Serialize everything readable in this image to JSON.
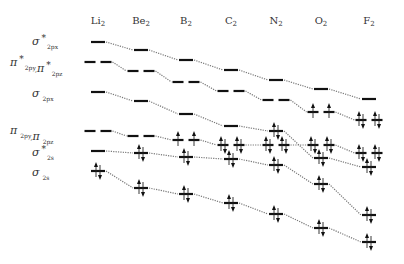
{
  "diagram": {
    "molecules": [
      {
        "label": "Li",
        "sub": "2",
        "x": 98
      },
      {
        "label": "Be",
        "sub": "2",
        "x": 141
      },
      {
        "label": "B",
        "sub": "2",
        "x": 186
      },
      {
        "label": "C",
        "sub": "2",
        "x": 231
      },
      {
        "label": "N",
        "sub": "2",
        "x": 276
      },
      {
        "label": "O",
        "sub": "2",
        "x": 321
      },
      {
        "label": "F",
        "sub": "2",
        "x": 369
      }
    ],
    "orbital_labels": [
      {
        "id": "sigma_star_2px",
        "symbol": "σ",
        "star": "*",
        "sub": "2px",
        "y": 45
      },
      {
        "id": "pi_star_2p",
        "symbol": "π",
        "star": "*",
        "sub": "2py",
        "symbol2": "π",
        "star2": "*",
        "sub2": "2pz",
        "y": 66
      },
      {
        "id": "sigma_2px",
        "symbol": "σ",
        "star": "",
        "sub": "2px",
        "y": 97
      },
      {
        "id": "pi_2p",
        "symbol": "π",
        "star": "",
        "sub": "2py",
        "symbol2": "π",
        "star2": "",
        "sub2": "2pz",
        "y": 134
      },
      {
        "id": "sigma_star_2s",
        "symbol": "σ",
        "star": "*",
        "sub": "2s",
        "y": 156
      },
      {
        "id": "sigma_2s",
        "symbol": "σ",
        "star": "",
        "sub": "2s",
        "y": 176
      }
    ],
    "orbitals": {
      "sigma_star_2px": {
        "degenerate": false,
        "y": [
          42,
          50,
          60,
          70,
          80,
          89,
          99
        ],
        "electrons": [
          0,
          0,
          0,
          0,
          0,
          0,
          0
        ]
      },
      "pi_star_2p": {
        "degenerate": true,
        "y": [
          62,
          71,
          82,
          91,
          100,
          112,
          120
        ],
        "electrons": [
          0,
          0,
          0,
          0,
          0,
          2,
          4
        ]
      },
      "sigma_2px": {
        "degenerate": false,
        "y": [
          92,
          101,
          114,
          126,
          131,
          158,
          167
        ],
        "electrons": [
          0,
          0,
          0,
          0,
          2,
          2,
          2
        ]
      },
      "pi_2p": {
        "degenerate": true,
        "y": [
          131,
          136,
          140,
          145,
          145,
          145,
          153
        ],
        "electrons": [
          0,
          0,
          2,
          4,
          4,
          4,
          4
        ]
      },
      "sigma_star_2s": {
        "degenerate": false,
        "y": [
          151,
          153,
          157,
          159,
          165,
          184,
          215
        ],
        "electrons": [
          0,
          2,
          2,
          2,
          2,
          2,
          2
        ]
      },
      "sigma_2s": {
        "degenerate": false,
        "y": [
          171,
          188,
          194,
          203,
          214,
          228,
          242
        ],
        "electrons": [
          2,
          2,
          2,
          2,
          2,
          2,
          2
        ]
      }
    },
    "colors": {
      "level": "#111111",
      "connector": "#777777",
      "text": "#333333",
      "background": "#ffffff"
    }
  }
}
